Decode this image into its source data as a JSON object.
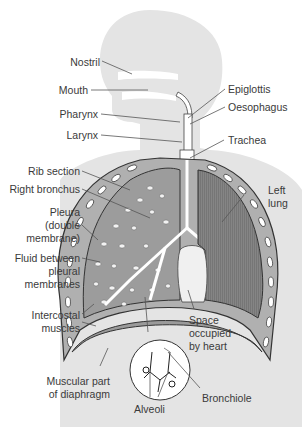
{
  "diagram": {
    "colors": {
      "silhouette": "#e3e3e3",
      "lung_tissue": "#9a9a9a",
      "left_lung": "#7e7e7e",
      "rib": "#ffffff",
      "outline": "#333333",
      "leader_line": "#555555"
    },
    "labels": {
      "nostril": "Nostril",
      "mouth": "Mouth",
      "pharynx": "Pharynx",
      "larynx": "Larynx",
      "epiglottis": "Epiglottis",
      "oesophagus": "Oesophagus",
      "trachea": "Trachea",
      "rib_section": "Rib section",
      "right_bronchus": "Right bronchus",
      "pleura_1": "Pleura",
      "pleura_2": "(double",
      "pleura_3": "membrane)",
      "fluid_1": "Fluid between",
      "fluid_2": "pleural",
      "fluid_3": "membranes",
      "left_lung_1": "Left",
      "left_lung_2": "lung",
      "intercostal_1": "Intercostal",
      "intercostal_2": "muscles",
      "space_1": "Space",
      "space_2": "occupied",
      "space_3": "by heart",
      "diaphragm_1": "Muscular part",
      "diaphragm_2": "of diaphragm",
      "alveoli": "Alveoli",
      "bronchiole": "Bronchiole"
    }
  }
}
